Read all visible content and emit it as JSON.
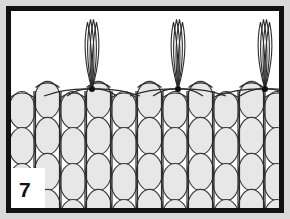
{
  "figure": {
    "number_label": "7",
    "kind": "beadwork-fringe-diagram",
    "caption_text": "",
    "panel": {
      "outer_background": "#d9d9d9",
      "frame_color": "#111111",
      "frame_thickness": 5,
      "interior_background": "#ffffff",
      "outer_margin": 6,
      "width": 290,
      "height": 219
    },
    "beads": {
      "fill": "#e7e7e7",
      "stroke": "#3a3a3a",
      "stroke_width": 1.1,
      "radius_x": 13,
      "radius_y": 18.5,
      "column_spacing": 25.5,
      "row_spacing": 36,
      "columns": 11,
      "rows": 4,
      "first_column_center_x": 22,
      "first_row_center_y": 110,
      "count_visible": 44
    },
    "threads": {
      "stroke": "#2b2b2b",
      "stroke_width": 1.2,
      "vertical_line_color": "#2b2b2b",
      "top_edge_y": 91,
      "bottom_edge_y": 214
    },
    "knots": {
      "color": "#111111",
      "radius": 3,
      "positions_x": [
        92,
        178,
        265
      ],
      "position_y": 89,
      "count": 3
    },
    "loops": {
      "description": "thread fringe loops rising above the bead rows",
      "stroke": "#2b2b2b",
      "stroke_width": 1.1,
      "strand_count_per_loop": 4,
      "top_y": 18,
      "count": 3,
      "anchors_x": [
        92,
        178,
        265
      ]
    }
  }
}
